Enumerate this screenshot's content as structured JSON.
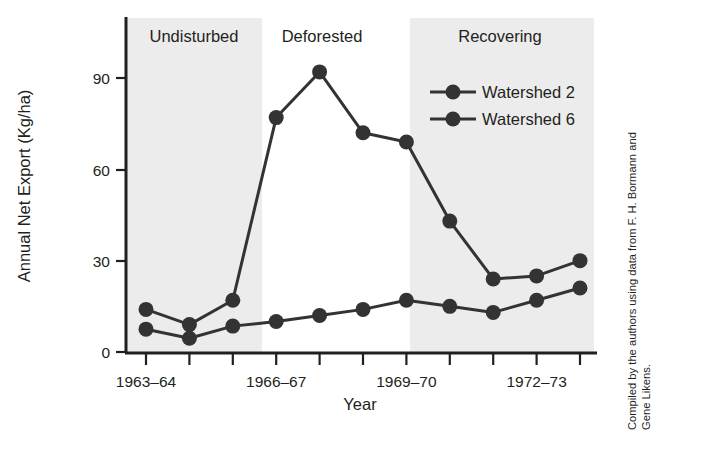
{
  "chart_data": {
    "type": "line",
    "title": "",
    "xlabel": "Year",
    "ylabel": "Annual Net Export (Kg/ha)",
    "ylim": [
      0,
      100
    ],
    "yticks": [
      0,
      30,
      60,
      90
    ],
    "ytick_labels": [
      "0",
      "30",
      "60",
      "90"
    ],
    "grid": false,
    "legend_position": "top-right",
    "x": [
      "1963-64",
      "1964-65",
      "1965-66",
      "1966-67",
      "1967-68",
      "1968-69",
      "1969-70",
      "1970-71",
      "1971-72",
      "1972-73",
      "1973-74"
    ],
    "xtick_labels_shown": [
      "1963–64",
      "1966–67",
      "1969–70",
      "1972–73"
    ],
    "xtick_label_indices": [
      0,
      3,
      6,
      9
    ],
    "n_ticks": 11,
    "series": [
      {
        "name": "Watershed 2",
        "color": "#333333",
        "marker": "filled-circle",
        "values": [
          14,
          9,
          17,
          77,
          92,
          72,
          69,
          43,
          24,
          25,
          30
        ]
      },
      {
        "name": "Watershed 6",
        "color": "#333333",
        "marker": "filled-circle",
        "values": [
          7.5,
          4.5,
          8.5,
          10,
          12,
          14,
          17,
          15,
          13,
          17,
          21
        ]
      }
    ],
    "bands": [
      {
        "label": "Undisturbed",
        "start_index": 0,
        "end_index": 3,
        "shaded": true,
        "shade_color": "#ececec"
      },
      {
        "label": "Deforested",
        "start_index": 3,
        "end_index": 6,
        "shaded": false,
        "shade_color": "#ffffff"
      },
      {
        "label": "Recovering",
        "start_index": 6,
        "end_index": 11,
        "shaded": true,
        "shade_color": "#ececec"
      }
    ]
  },
  "legend": {
    "entries": [
      {
        "label": "Watershed 2"
      },
      {
        "label": "Watershed 6"
      }
    ]
  },
  "axes": {
    "y_title": "Annual Net Export (Kg/ha)",
    "x_title": "Year",
    "y_ticks": [
      "90",
      "60",
      "30",
      "0"
    ],
    "x_ticks": [
      "1963–64",
      "1966–67",
      "1969–70",
      "1972–73"
    ]
  },
  "bands": {
    "undisturbed": "Undisturbed",
    "deforested": "Deforested",
    "recovering": "Recovering"
  },
  "credit": {
    "line1": "Compiled by the authors using data from F. H. Bormann and",
    "line2": "Gene Likens."
  }
}
